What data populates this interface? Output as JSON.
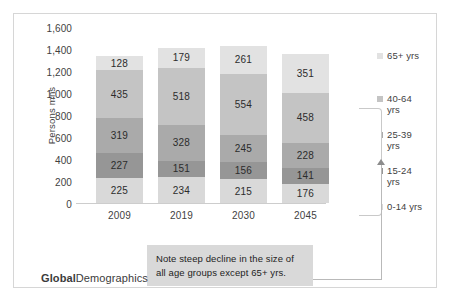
{
  "chart_data": {
    "type": "bar",
    "stacked": true,
    "title": "",
    "xlabel": "",
    "ylabel": "Persons mns",
    "ylim": [
      0,
      1600
    ],
    "ytick_step": 200,
    "yticks": [
      "0",
      "200",
      "400",
      "600",
      "800",
      "1,000",
      "1,200",
      "1,400",
      "1,600"
    ],
    "grid": false,
    "legend_position": "right",
    "categories": [
      "2009",
      "2019",
      "2030",
      "2045"
    ],
    "series": [
      {
        "name": "0-14 yrs",
        "values": [
          225,
          234,
          215,
          176
        ],
        "color": "#d9d9d9"
      },
      {
        "name": "15-24 yrs",
        "values": [
          227,
          151,
          156,
          141
        ],
        "color": "#969696"
      },
      {
        "name": "25-39 yrs",
        "values": [
          319,
          328,
          245,
          228
        ],
        "color": "#aaaaaa"
      },
      {
        "name": "40-64 yrs",
        "values": [
          435,
          518,
          554,
          458
        ],
        "color": "#c4c4c4"
      },
      {
        "name": "65+ yrs",
        "values": [
          128,
          179,
          261,
          351
        ],
        "color": "#e2e2e2"
      }
    ],
    "totals": [
      1334,
      1410,
      1431,
      1354
    ],
    "annotations": [
      {
        "name": "note",
        "line1": "Note steep decline in the size of",
        "line2": "all age groups except 65+ yrs.",
        "target": "2045"
      }
    ]
  },
  "legend": {
    "items": [
      {
        "label_line1": "65+ yrs",
        "label_line2": "",
        "color": "#e2e2e2"
      },
      {
        "label_line1": "40-64",
        "label_line2": "yrs",
        "color": "#c4c4c4"
      },
      {
        "label_line1": "25-39",
        "label_line2": "yrs",
        "color": "#aaaaaa"
      },
      {
        "label_line1": "15-24",
        "label_line2": "yrs",
        "color": "#969696"
      },
      {
        "label_line1": "0-14 yrs",
        "label_line2": "",
        "color": "#d9d9d9"
      }
    ]
  },
  "note": {
    "line1": "Note steep decline in the size of",
    "line2": "all age groups except 65+ yrs."
  },
  "logo": {
    "strong": "Global",
    "light": "Demographics"
  }
}
